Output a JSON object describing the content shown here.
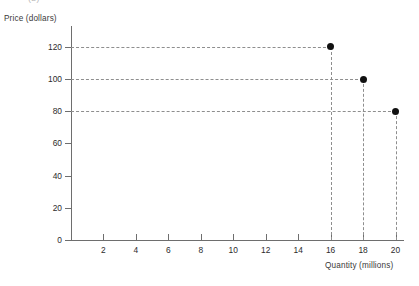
{
  "panel": {
    "tag": "(b)"
  },
  "chart_data": {
    "type": "scatter",
    "title": "",
    "subtitle": "",
    "xlabel": "Quantity (millions)",
    "ylabel": "Price (dollars)",
    "xlim": [
      0,
      22
    ],
    "ylim": [
      0,
      130
    ],
    "grid": false,
    "legend": null,
    "x_ticks": [
      2,
      4,
      6,
      8,
      10,
      12,
      14,
      16,
      18,
      20
    ],
    "x_tick_labels": [
      "2",
      "4",
      "6",
      "8",
      "10",
      "12",
      "14",
      "16",
      "18",
      "20"
    ],
    "y_ticks": [
      0,
      20,
      40,
      60,
      80,
      100,
      120
    ],
    "y_tick_labels": [
      "0",
      "20",
      "40",
      "60",
      "80",
      "100",
      "120"
    ],
    "points": [
      {
        "x": 16,
        "y": 120,
        "label": ""
      },
      {
        "x": 18,
        "y": 100,
        "label": ""
      },
      {
        "x": 20,
        "y": 80,
        "label": ""
      }
    ],
    "guides": {
      "horizontal_from_y_axis": [
        120,
        100,
        80
      ],
      "vertical_to_x_axis": [
        16,
        18,
        20
      ],
      "style": "dashed"
    },
    "colors": {
      "point": "#111111",
      "axis": "#6e6e6e",
      "guide": "#8e8e8e",
      "text": "#2c2c2c",
      "background": "#ffffff"
    }
  }
}
